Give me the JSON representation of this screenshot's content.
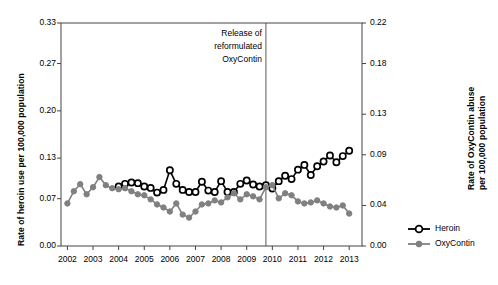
{
  "chart_data": {
    "type": "line",
    "title": "",
    "subtitle": "",
    "xlabel": "",
    "ylabel": "Rate of heroin use per 100,000 population",
    "y2label": "Rate of OxyContin abuse per 100,000 population",
    "grid": false,
    "legend_position": "right",
    "xlim": [
      2001.75,
      2013.5
    ],
    "ylim": [
      0.0,
      0.33
    ],
    "y2lim": [
      0.0,
      0.22
    ],
    "xticks": [
      2002,
      2003,
      2004,
      2005,
      2006,
      2007,
      2008,
      2009,
      2010,
      2011,
      2012,
      2013
    ],
    "xtick_labels": [
      "2002",
      "2003",
      "2004",
      "2005",
      "2006",
      "2007",
      "2008",
      "2009",
      "2010",
      "2011",
      "2012",
      "2013"
    ],
    "yticks": [
      0.0,
      0.07,
      0.13,
      0.2,
      0.27,
      0.33
    ],
    "ytick_labels": [
      "0.00",
      "0.07",
      "0.13",
      "0.20",
      "0.27",
      "0.33"
    ],
    "y2ticks": [
      0.0,
      0.04,
      0.09,
      0.13,
      0.18,
      0.22
    ],
    "y2tick_labels": [
      "0.00",
      "0.04",
      "0.09",
      "0.13",
      "0.18",
      "0.22"
    ],
    "annotations": [
      {
        "name": "reformulation-marker",
        "lines": [
          "Release of",
          "reformulated",
          "OxyContin"
        ],
        "x": 2009.75,
        "type": "vertical-line-with-text"
      }
    ],
    "series": [
      {
        "name": "Heroin",
        "axis": "left",
        "color": "#000000",
        "marker": "open-circle",
        "x": [
          2004.0,
          2004.25,
          2004.5,
          2004.75,
          2005.0,
          2005.25,
          2005.5,
          2005.75,
          2006.0,
          2006.25,
          2006.5,
          2006.75,
          2007.0,
          2007.25,
          2007.5,
          2007.75,
          2008.0,
          2008.25,
          2008.5,
          2008.75,
          2009.0,
          2009.25,
          2009.5,
          2009.75,
          2010.0,
          2010.25,
          2010.5,
          2010.75,
          2011.0,
          2011.25,
          2011.5,
          2011.75,
          2012.0,
          2012.25,
          2012.5,
          2012.75,
          2013.0
        ],
        "values": [
          0.088,
          0.092,
          0.094,
          0.093,
          0.088,
          0.086,
          0.079,
          0.083,
          0.112,
          0.092,
          0.083,
          0.08,
          0.08,
          0.095,
          0.082,
          0.08,
          0.096,
          0.08,
          0.08,
          0.092,
          0.097,
          0.091,
          0.088,
          0.09,
          0.085,
          0.096,
          0.104,
          0.099,
          0.113,
          0.12,
          0.105,
          0.118,
          0.125,
          0.134,
          0.124,
          0.133,
          0.141
        ]
      },
      {
        "name": "OxyContin",
        "axis": "right",
        "color": "#808080",
        "marker": "filled-circle",
        "x": [
          2002.0,
          2002.25,
          2002.5,
          2002.75,
          2003.0,
          2003.25,
          2003.5,
          2003.75,
          2004.0,
          2004.25,
          2004.5,
          2004.75,
          2005.0,
          2005.25,
          2005.5,
          2005.75,
          2006.0,
          2006.25,
          2006.5,
          2006.75,
          2007.0,
          2007.25,
          2007.5,
          2007.75,
          2008.0,
          2008.25,
          2008.5,
          2008.75,
          2009.0,
          2009.25,
          2009.5,
          2009.75,
          2010.0,
          2010.25,
          2010.5,
          2010.75,
          2011.0,
          2011.25,
          2011.5,
          2011.75,
          2012.0,
          2012.25,
          2012.5,
          2012.75,
          2013.0
        ],
        "values": [
          0.042,
          0.054,
          0.061,
          0.051,
          0.058,
          0.068,
          0.06,
          0.057,
          0.056,
          0.057,
          0.054,
          0.051,
          0.05,
          0.046,
          0.041,
          0.038,
          0.034,
          0.042,
          0.031,
          0.028,
          0.034,
          0.041,
          0.042,
          0.045,
          0.043,
          0.048,
          0.052,
          0.046,
          0.051,
          0.049,
          0.046,
          0.058,
          0.06,
          0.047,
          0.052,
          0.05,
          0.044,
          0.042,
          0.043,
          0.045,
          0.042,
          0.039,
          0.038,
          0.04,
          0.032
        ]
      }
    ],
    "legend": [
      {
        "label": "Heroin",
        "color": "#000000",
        "marker": "open-circle"
      },
      {
        "label": "OxyContin",
        "color": "#808080",
        "marker": "filled-circle"
      }
    ]
  }
}
